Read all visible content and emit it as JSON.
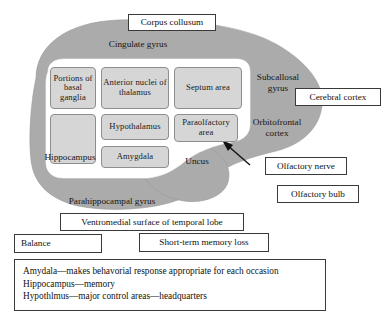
{
  "figure": {
    "colors": {
      "brain_fill": "#ababab",
      "inner_white": "#ffffff",
      "region_fill": "#d6d6d6",
      "region_border": "#8e8e8e",
      "box_border": "#3a3a3a",
      "text": "#111111"
    }
  },
  "regions": [
    {
      "label": "Portions of basal ganglia"
    },
    {
      "label": "Anterior nuclei of thalamus"
    },
    {
      "label": "Septum area"
    },
    {
      "label": ""
    },
    {
      "label": "Hypothalamus"
    },
    {
      "label": "Paraolfactory area"
    },
    {
      "label": ""
    },
    {
      "label": "Amygdala"
    }
  ],
  "free_labels": [
    {
      "name": "cingulate-gyrus",
      "text": "Cingulate gyrus"
    },
    {
      "name": "subcallosal-gyrus",
      "text": "Subcallosal gyrus"
    },
    {
      "name": "orbitofrontal-cortex",
      "text": "Orbitofrontal cortex"
    },
    {
      "name": "hippocampus",
      "text": "Hippocampus"
    },
    {
      "name": "uncus",
      "text": "Uncus"
    },
    {
      "name": "parahippocampal-gyrus",
      "text": "Parahippocampal gyrus"
    }
  ],
  "callouts": [
    {
      "name": "corpus-collusum",
      "text": "Corpus collusum"
    },
    {
      "name": "cerebral-cortex",
      "text": "Cerebral cortex"
    },
    {
      "name": "olfactory-nerve",
      "text": "Olfactory nerve"
    },
    {
      "name": "olfactory-bulb",
      "text": "Olfactory bulb"
    },
    {
      "name": "ventromedial-surface",
      "text": "Ventromedial surface of temporal lobe"
    },
    {
      "name": "balance",
      "text": "Balance"
    },
    {
      "name": "short-term-memory-loss",
      "text": "Short-term memory loss"
    }
  ],
  "legend": {
    "lines": [
      "Amydala—makes behavorial response appropriate for each occasion",
      "Hippocampus—memory",
      "Hypothlmus—major control areas—headquarters"
    ]
  }
}
